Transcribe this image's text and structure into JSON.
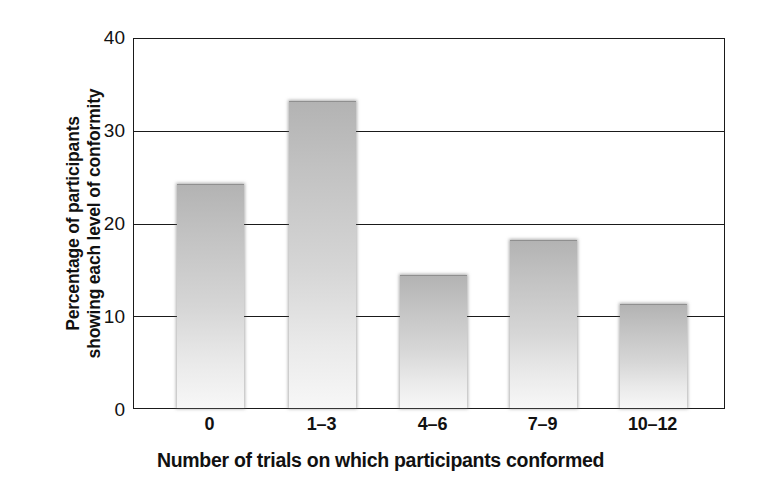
{
  "chart_data": {
    "type": "bar",
    "title": "",
    "subtitle": "",
    "xlabel": "Number of trials on which participants conformed",
    "ylabel": "Percentage of participants showing each level of conformity",
    "ylabel_lines": [
      "Percentage of participants",
      "showing each level of conformity"
    ],
    "categories": [
      "0",
      "1–3",
      "4–6",
      "7–9",
      "10–12"
    ],
    "values": [
      24.2,
      33.2,
      14.3,
      18.1,
      11.2
    ],
    "series": [
      {
        "name": "Percentage of participants",
        "values": [
          24.2,
          33.2,
          14.3,
          18.1,
          11.2
        ]
      }
    ],
    "ylim": [
      0,
      40
    ],
    "yticks": [
      0,
      10,
      20,
      30,
      40
    ],
    "ytick_labels": [
      "0",
      "10",
      "20",
      "30",
      "40"
    ],
    "xlim_categories": 5,
    "grid": "horizontal",
    "legend": "none",
    "bar_fill_top_color": "#b3b3b3",
    "bar_fill_bottom_color": "#f7f7f7",
    "axis_color": "#1a1a1a",
    "background_color": "#ffffff",
    "annotations": []
  }
}
